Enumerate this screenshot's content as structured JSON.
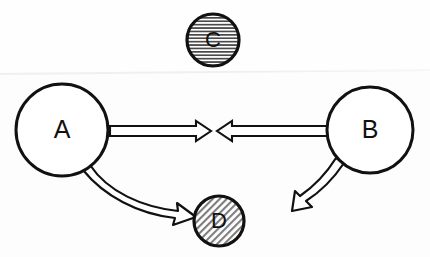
{
  "diagram": {
    "style": "hand-drawn scanned line art",
    "background_color": "#fdfdfd",
    "stroke_color": "#111111",
    "fill_white": "#ffffff",
    "hatch_gray": "#8a8a8a",
    "nodes": [
      {
        "id": "C",
        "label": "C",
        "cx": 213,
        "cy": 40,
        "r": 27,
        "fill_style": "horizontal-hatch",
        "fill_color": "#e6e6e6",
        "stroke_width": 3.2,
        "font_size": 22
      },
      {
        "id": "A",
        "label": "A",
        "cx": 62,
        "cy": 130,
        "r": 47,
        "fill_style": "solid-white",
        "fill_color": "#ffffff",
        "stroke_width": 3.0,
        "font_size": 25
      },
      {
        "id": "B",
        "label": "B",
        "cx": 370,
        "cy": 130,
        "r": 44,
        "fill_style": "solid-white",
        "fill_color": "#ffffff",
        "stroke_width": 3.0,
        "font_size": 25
      },
      {
        "id": "D",
        "label": "D",
        "cx": 219,
        "cy": 221,
        "r": 26,
        "fill_style": "diagonal-hatch",
        "fill_color": "#dcdcdc",
        "stroke_width": 3.2,
        "font_size": 22
      }
    ],
    "arrows": [
      {
        "id": "a-to-b",
        "from": "A",
        "to": "midpoint",
        "shape": "straight-block-arrow",
        "direction": "right",
        "tail_x": 110,
        "tip_x": 211,
        "y": 131,
        "shaft_half_height": 5,
        "head_half_height": 10,
        "head_length": 15
      },
      {
        "id": "b-to-a",
        "from": "B",
        "to": "midpoint",
        "shape": "straight-block-arrow",
        "direction": "left",
        "tail_x": 327,
        "tip_x": 217,
        "y": 131,
        "shaft_half_height": 5,
        "head_half_height": 10,
        "head_length": 15
      },
      {
        "id": "a-to-d",
        "from": "A",
        "to": "D",
        "shape": "curved-block-arrow",
        "direction": "down-right",
        "start_x": 92,
        "start_y": 168,
        "end_x": 191,
        "end_y": 215
      },
      {
        "id": "b-outgoing",
        "from": "B",
        "to": "none",
        "shape": "curved-block-arrow",
        "direction": "down-left",
        "start_x": 341,
        "start_y": 166,
        "end_x": 296,
        "end_y": 207
      }
    ],
    "scan_artifact": {
      "present": true,
      "y": 72,
      "color": "#f1f1f1"
    }
  }
}
